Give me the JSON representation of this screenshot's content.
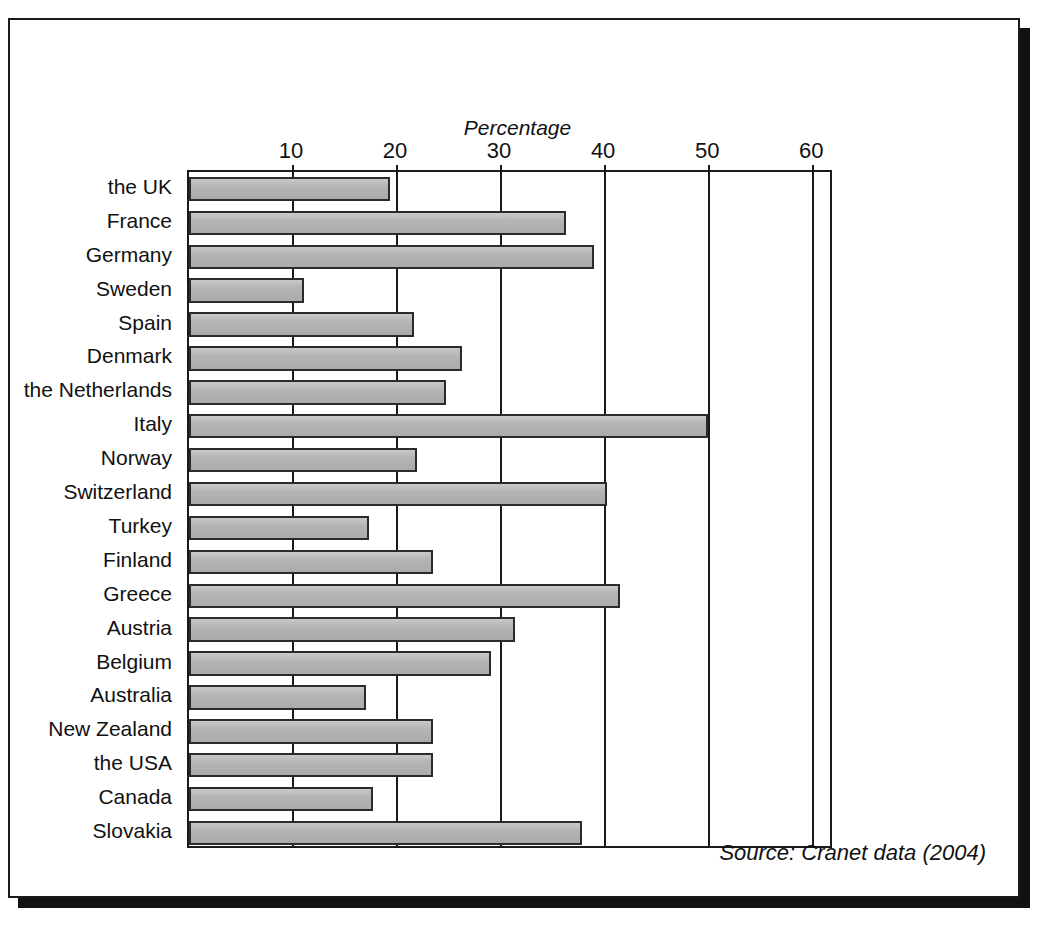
{
  "figure": {
    "top_cut_text": "",
    "source_note": "Source: Cranet data (2004)"
  },
  "chart_data": {
    "type": "bar",
    "orientation": "horizontal",
    "title": "",
    "xlabel": "Percentage",
    "ylabel": "",
    "xlim": [
      0,
      62
    ],
    "xticks": [
      10,
      20,
      30,
      40,
      50,
      60
    ],
    "xtick_labels": [
      "10",
      "20",
      "30",
      "40",
      "50",
      "60"
    ],
    "grid": true,
    "legend": null,
    "bar_fill_color": "#b4b4b4",
    "bar_edge_color": "#2b2b2b",
    "categories": [
      "the UK",
      "France",
      "Germany",
      "Sweden",
      "Spain",
      "Denmark",
      "the Netherlands",
      "Italy",
      "Norway",
      "Switzerland",
      "Turkey",
      "Finland",
      "Greece",
      "Austria",
      "Belgium",
      "Australia",
      "New Zealand",
      "the USA",
      "Canada",
      "Slovakia"
    ],
    "values": [
      19.3,
      36.2,
      38.9,
      11.1,
      21.6,
      26.2,
      24.7,
      49.9,
      21.9,
      40.2,
      17.3,
      23.5,
      41.4,
      31.3,
      29.0,
      17.0,
      23.5,
      23.5,
      17.7,
      37.8
    ]
  }
}
